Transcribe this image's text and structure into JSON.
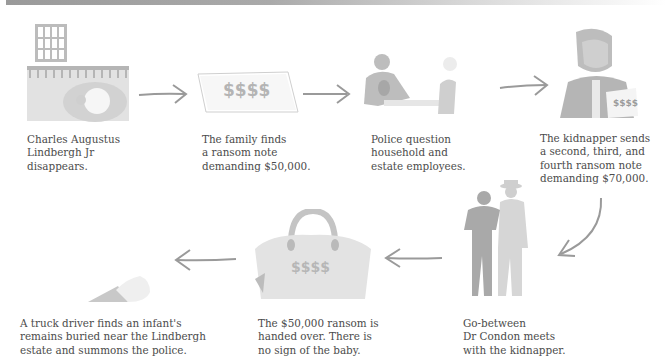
{
  "diagram": {
    "type": "timeline-flow",
    "steps": [
      {
        "id": 1,
        "illustration": "nursery-window-crib",
        "caption": "Charles Augustus\nLindbergh Jr\ndisappears."
      },
      {
        "id": 2,
        "illustration": "ransom-note",
        "note_text": "$$$$",
        "caption": "The family finds\na ransom note\ndemanding $50,000."
      },
      {
        "id": 3,
        "illustration": "police-interview",
        "caption": "Police question\nhousehold and\nestate employees."
      },
      {
        "id": 4,
        "illustration": "kidnapper-with-note",
        "note_text": "$$$$",
        "caption": "The kidnapper sends\na second, third, and\nfourth ransom note\ndemanding $70,000."
      },
      {
        "id": 5,
        "illustration": "two-men-meeting",
        "caption": "Go-between\nDr Condon meets\nwith the kidnapper."
      },
      {
        "id": 6,
        "illustration": "money-bag",
        "bag_text": "$$$$",
        "caption": "The $50,000 ransom is\nhanded over. There is\nno sign of the baby."
      },
      {
        "id": 7,
        "illustration": "infant-foot",
        "caption": "A truck driver finds an infant's\nremains buried near the Lindbergh\nestate and summons the police."
      }
    ],
    "colors": {
      "art": "#c8c8c8",
      "art_dark": "#a9a9a9",
      "arrow": "#9a9a9a",
      "text": "#4b4b4b",
      "topbar": "#9a9a9a"
    }
  }
}
